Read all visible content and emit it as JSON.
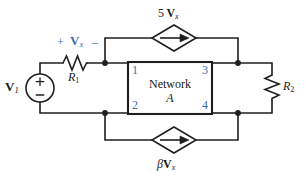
{
  "diagram": {
    "colors": {
      "wire": "#1f1f1f",
      "blue_label": "#3d6fa5",
      "box_fill": "#ffffff",
      "box_border": "#1f1f1f",
      "background": "#ffffff"
    },
    "box": {
      "line1": "Network",
      "line2": "A",
      "node_labels": {
        "top_left": "1",
        "bottom_left": "2",
        "top_right": "3",
        "bottom_right": "4"
      }
    },
    "labels": {
      "source_v1": {
        "main": "V",
        "sub": "1"
      },
      "resistor_r1": {
        "main": "R",
        "sub": "1"
      },
      "resistor_r2": {
        "main": "R",
        "sub": "2"
      },
      "vx_polarity_plus": "+",
      "vx_polarity_minus": "–",
      "vx": {
        "main": "V",
        "sub": "x"
      },
      "top_source": {
        "coef": "5",
        "main": "V",
        "sub": "x"
      },
      "bottom_source": {
        "coef": "β",
        "main": "V",
        "sub": "x"
      },
      "source_plus": "+",
      "source_minus": "–"
    }
  }
}
